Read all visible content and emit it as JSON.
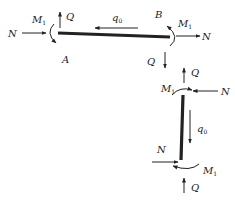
{
  "diagram": {
    "colors": {
      "ink": "#222222",
      "background": "#ffffff"
    },
    "horizontal_segment": {
      "left_end_label": "A",
      "right_end_label": "B",
      "distributed_load": {
        "symbol": "q",
        "subscript": "0",
        "direction": "left"
      },
      "left_end": {
        "axial": {
          "symbol": "N",
          "direction": "right"
        },
        "shear": {
          "symbol": "Q",
          "direction": "up"
        },
        "moment": {
          "symbol": "M",
          "subscript": "1",
          "direction": "counterclockwise"
        }
      },
      "right_end": {
        "axial": {
          "symbol": "N",
          "direction": "right"
        },
        "shear": {
          "symbol": "Q",
          "direction": "down"
        },
        "moment": {
          "symbol": "M",
          "subscript": "1",
          "direction": "clockwise"
        }
      }
    },
    "vertical_segment": {
      "distributed_load": {
        "symbol": "q",
        "subscript": "0",
        "direction": "down"
      },
      "top_end": {
        "axial": {
          "symbol": "N",
          "direction": "left"
        },
        "shear": {
          "symbol": "Q",
          "direction": "up"
        },
        "moment": {
          "symbol": "M",
          "subscript": "1",
          "direction": "clockwise"
        }
      },
      "bottom_end": {
        "axial": {
          "symbol": "N",
          "direction": "right"
        },
        "shear": {
          "symbol": "Q",
          "direction": "up"
        },
        "moment": {
          "symbol": "M",
          "subscript": "1",
          "direction": "clockwise"
        }
      }
    }
  }
}
